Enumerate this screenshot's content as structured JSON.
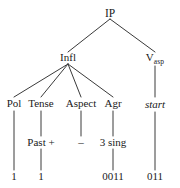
{
  "figure": {
    "type": "syntactic-tree-diagram",
    "background_color": "#ffffff",
    "line_color": "#3a3a3a",
    "text_color": "#1a1a1a"
  },
  "nodes": {
    "root": {
      "label": "IP",
      "x": 110,
      "y": 14
    },
    "infl": {
      "label": "Infl",
      "x": 68,
      "y": 59
    },
    "vasp": {
      "label": "V",
      "subscript": "asp",
      "x": 155,
      "y": 59
    }
  },
  "infl_children": [
    {
      "label": "Pol",
      "x": 14,
      "y": 105,
      "value": "",
      "terminal": "1"
    },
    {
      "label": "Tense",
      "x": 41,
      "y": 105,
      "value": "Past +",
      "terminal": "1"
    },
    {
      "label": "Aspect",
      "x": 81,
      "y": 105,
      "value": "–",
      "terminal": ""
    },
    {
      "label": "Agr",
      "x": 113,
      "y": 105,
      "value": "3 sing",
      "terminal": "0011"
    }
  ],
  "vasp_branch": {
    "value": "start",
    "value_italic": true,
    "terminal": "011",
    "x": 155
  },
  "rows": {
    "category_row_y": 105,
    "value_row_y": 143,
    "terminal_row_y": 177
  }
}
